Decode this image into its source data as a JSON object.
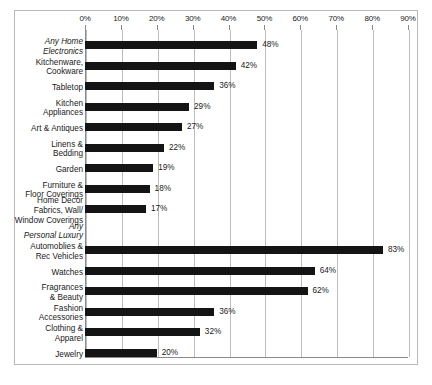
{
  "chart_data": {
    "type": "bar",
    "orientation": "horizontal",
    "title": "",
    "subtitle": "",
    "xlabel": "",
    "ylabel": "",
    "xlim": [
      0,
      90
    ],
    "xtick_labels": [
      "0%",
      "10%",
      "20%",
      "30%",
      "40%",
      "50%",
      "60%",
      "70%",
      "80%",
      "90%"
    ],
    "xticks": [
      0,
      10,
      20,
      30,
      40,
      50,
      60,
      70,
      80,
      90
    ],
    "grid": true,
    "grid_axis": "x",
    "legend": false,
    "bar_color": "#141414",
    "value_label_suffix": "%",
    "categories": [
      "Any Home\nElectronics",
      "Kitchenware,\nCookware",
      "Tabletop",
      "Kitchen\nAppliances",
      "Art & Antiques",
      "Linens &\nBedding",
      "Garden",
      "Furniture &\nFloor Coverings",
      "Home Decor\nFabrics, Wall/\nWindow Coverings",
      "Any\nPersonal Luxury",
      "Automoblies &\nRec Vehicles",
      "Watches",
      "Fragrances\n& Beauty",
      "Fashion\nAccessories",
      "Clothing &\nApparel",
      "Jewelry"
    ],
    "values": [
      48,
      42,
      36,
      29,
      27,
      22,
      19,
      18,
      17,
      null,
      83,
      64,
      62,
      36,
      32,
      20
    ],
    "value_labels": [
      "48%",
      "42%",
      "36%",
      "29%",
      "27%",
      "22%",
      "19%",
      "18%",
      "17%",
      "",
      "83%",
      "64%",
      "62%",
      "36%",
      "32%",
      "20%"
    ],
    "group_headers": [
      "Any Home\nElectronics",
      "Any\nPersonal Luxury"
    ],
    "rows": [
      {
        "label": "Any Home\nElectronics",
        "value": 48,
        "value_label": "48%",
        "is_group_header": true,
        "has_bar": true
      },
      {
        "label": "Kitchenware,\nCookware",
        "value": 42,
        "value_label": "42%",
        "is_group_header": false,
        "has_bar": true
      },
      {
        "label": "Tabletop",
        "value": 36,
        "value_label": "36%",
        "is_group_header": false,
        "has_bar": true
      },
      {
        "label": "Kitchen\nAppliances",
        "value": 29,
        "value_label": "29%",
        "is_group_header": false,
        "has_bar": true
      },
      {
        "label": "Art & Antiques",
        "value": 27,
        "value_label": "27%",
        "is_group_header": false,
        "has_bar": true
      },
      {
        "label": "Linens &\nBedding",
        "value": 22,
        "value_label": "22%",
        "is_group_header": false,
        "has_bar": true
      },
      {
        "label": "Garden",
        "value": 19,
        "value_label": "19%",
        "is_group_header": false,
        "has_bar": true
      },
      {
        "label": "Furniture &\nFloor Coverings",
        "value": 18,
        "value_label": "18%",
        "is_group_header": false,
        "has_bar": true
      },
      {
        "label": "Home Decor\nFabrics, Wall/\nWindow Coverings",
        "value": 17,
        "value_label": "17%",
        "is_group_header": false,
        "has_bar": true
      },
      {
        "label": "Any\nPersonal Luxury",
        "value": null,
        "value_label": "",
        "is_group_header": true,
        "has_bar": false
      },
      {
        "label": "Automoblies &\nRec Vehicles",
        "value": 83,
        "value_label": "83%",
        "is_group_header": false,
        "has_bar": true
      },
      {
        "label": "Watches",
        "value": 64,
        "value_label": "64%",
        "is_group_header": false,
        "has_bar": true
      },
      {
        "label": "Fragrances\n& Beauty",
        "value": 62,
        "value_label": "62%",
        "is_group_header": false,
        "has_bar": true
      },
      {
        "label": "Fashion\nAccessories",
        "value": 36,
        "value_label": "36%",
        "is_group_header": false,
        "has_bar": true
      },
      {
        "label": "Clothing &\nApparel",
        "value": 32,
        "value_label": "32%",
        "is_group_header": false,
        "has_bar": true
      },
      {
        "label": "Jewelry",
        "value": 20,
        "value_label": "20%",
        "is_group_header": false,
        "has_bar": true
      }
    ]
  }
}
